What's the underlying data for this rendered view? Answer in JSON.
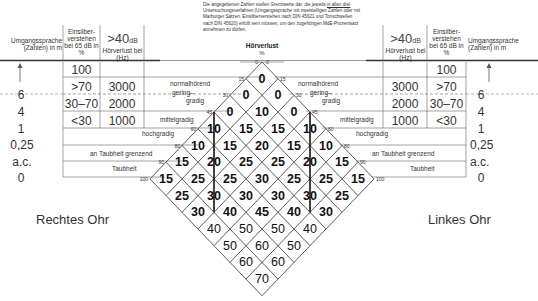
{
  "note": {
    "text_before": "Die angegebenen Zahlen stellen Grenzwerte dar, die jeweils ",
    "underlined": "in allen drei",
    "text_after": " Untersuchungsverfahren (Umgangssprache mit zweistelligen Zahlen oder mit Marburger Sätzen, Einsilberverstehen nach DIN 45621 und Tonschwellen nach DIN 45620) erfüllt sein müssen, um den zugehörigen MdE-Prozentsatz annehmen zu dürfen."
  },
  "center_header": {
    "title": "Hörverlust",
    "unit": "%"
  },
  "left": {
    "col_speech": "Umgangssprache (Zahlen) in m",
    "col_einsilber": "Einsilber-verstehen bei 65 dB in %",
    "col_40db_big": ">40",
    "col_40db_unit": "dB",
    "col_40db_sub": "Hörverlust bei (Hz)",
    "speech_values": [
      "↑",
      "6",
      "4",
      "1",
      "0,25",
      "a.c.",
      "0"
    ],
    "einsilber_values": [
      "100",
      ">70",
      "30–70",
      "<30"
    ],
    "hz_values": [
      "",
      "3000",
      "2000",
      "1000"
    ],
    "ear": "Rechtes Ohr"
  },
  "right": {
    "col_speech": "Umgangssprache (Zahlen) in m",
    "col_einsilber": "Einsilber-verstehen bei 65 dB in %",
    "col_40db_big": ">40",
    "col_40db_unit": "dB",
    "col_40db_sub": "Hörverlust bei (Hz)",
    "speech_values": [
      "↑",
      "6",
      "4",
      "1",
      "0,25",
      "a.c.",
      "0"
    ],
    "einsilber_values": [
      "100",
      ">70",
      "30–70",
      "<30"
    ],
    "hz_values": [
      "",
      "3000",
      "2000",
      "1000"
    ],
    "ear": "Linkes Ohr"
  },
  "categories": [
    {
      "label": "normalhörend",
      "tick": "15"
    },
    {
      "label": "gering-gradig",
      "label1": "gering–",
      "label2": "gradig",
      "tick": "30"
    },
    {
      "label": "mittelgradig",
      "tick": "45"
    },
    {
      "label": "hochgradig",
      "tick": "60"
    },
    {
      "label": "an Taubheit grenzend",
      "tick": "80"
    },
    {
      "label": "Taubheit",
      "tick": "90"
    },
    {
      "label": "",
      "tick": "100"
    }
  ],
  "ticks": [
    "0",
    "15",
    "30",
    "45",
    "60",
    "80",
    "90",
    "100"
  ],
  "mde_grid_rows": [
    [
      "0"
    ],
    [
      "0",
      "0"
    ],
    [
      "0",
      "10",
      "0"
    ],
    [
      "10",
      "15",
      "15",
      "10"
    ],
    [
      "10",
      "15",
      "20",
      "15",
      "10"
    ],
    [
      "15",
      "20",
      "25",
      "25",
      "20",
      "15"
    ],
    [
      "15",
      "25",
      "25",
      "30",
      "25",
      "25",
      "15"
    ],
    [
      "25",
      "30",
      "30",
      "30",
      "30",
      "25"
    ],
    [
      "30",
      "40",
      "45",
      "40",
      "30"
    ],
    [
      "40",
      "50",
      "50",
      "40"
    ],
    [
      "50",
      "60",
      "50"
    ],
    [
      "60",
      "60"
    ],
    [
      "70"
    ]
  ]
}
